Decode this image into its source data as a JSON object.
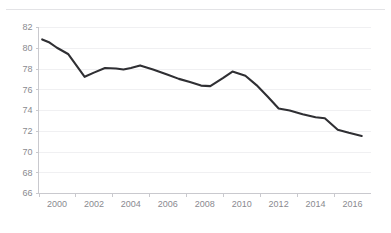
{
  "header": {
    "rule_visible": true,
    "title_fragment": ""
  },
  "chart_data": {
    "type": "line",
    "title": "",
    "subtitle": "",
    "xlabel": "",
    "ylabel": "",
    "xlim": [
      1999.2,
      2016.6
    ],
    "ylim": [
      66,
      82
    ],
    "grid": true,
    "legend": null,
    "line_color": "#2f2f33",
    "grid_color": "#f0f0f2",
    "axis_color": "#c9c9ce",
    "tick_text_color": "#8a8a90",
    "y_ticks": [
      66,
      68,
      70,
      72,
      74,
      76,
      78,
      80,
      82
    ],
    "x_ticks": [
      2000,
      2002,
      2004,
      2006,
      2008,
      2010,
      2012,
      2014,
      2016
    ],
    "x_minor_ticks": [
      1999,
      2001,
      2003,
      2005,
      2007,
      2009,
      2011,
      2013,
      2015,
      2017
    ],
    "x": [
      1999.2,
      1999.6,
      2000.0,
      2000.6,
      2001.5,
      2002.0,
      2002.6,
      2003.2,
      2003.6,
      2004.0,
      2004.5,
      2005.2,
      2006.0,
      2006.6,
      2007.2,
      2007.8,
      2008.3,
      2009.0,
      2009.5,
      2010.2,
      2010.8,
      2011.4,
      2012.0,
      2012.6,
      2013.3,
      2014.0,
      2014.5,
      2015.2,
      2015.8,
      2016.5
    ],
    "values": [
      80.8,
      80.5,
      80.0,
      79.4,
      77.2,
      77.6,
      78.05,
      78.0,
      77.9,
      78.05,
      78.3,
      77.9,
      77.4,
      77.0,
      76.7,
      76.35,
      76.3,
      77.1,
      77.7,
      77.3,
      76.4,
      75.3,
      74.15,
      73.95,
      73.6,
      73.3,
      73.2,
      72.1,
      71.8,
      71.5
    ]
  }
}
